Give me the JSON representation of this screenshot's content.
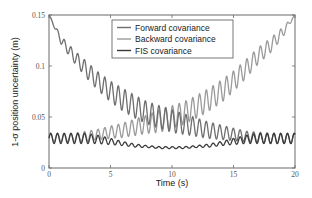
{
  "chart_data": {
    "type": "line",
    "title": "",
    "xlabel": "Time (s)",
    "ylabel": "1-σ position uncertainty (m)",
    "xlim": [
      0,
      20
    ],
    "ylim": [
      0,
      0.15
    ],
    "xticks": [
      0,
      5,
      10,
      15,
      20
    ],
    "xtick_labels": [
      "0",
      "5",
      "10",
      "15",
      "20"
    ],
    "yticks": [
      0,
      0.05,
      0.1,
      0.15
    ],
    "ytick_labels": [
      "0",
      "0.05",
      "0.1",
      "0.15"
    ],
    "grid": false,
    "legend_position": "upper center",
    "oscillation_period_s": 0.55,
    "series": [
      {
        "name": "Forward covariance",
        "color": "#6e6e6e",
        "x": [
          0,
          1,
          2,
          3,
          4,
          5,
          6,
          7,
          8,
          9,
          10,
          11,
          12,
          13,
          14,
          15,
          16,
          17,
          18,
          19,
          20
        ],
        "values": [
          0.15,
          0.125,
          0.11,
          0.097,
          0.085,
          0.075,
          0.067,
          0.06,
          0.054,
          0.05,
          0.046,
          0.043,
          0.04,
          0.037,
          0.035,
          0.033,
          0.031,
          0.03,
          0.029,
          0.029,
          0.029
        ],
        "amplitude": [
          0.0,
          0.004,
          0.006,
          0.008,
          0.009,
          0.01,
          0.011,
          0.011,
          0.011,
          0.011,
          0.011,
          0.01,
          0.009,
          0.008,
          0.007,
          0.006,
          0.005,
          0.005,
          0.005,
          0.005,
          0.005
        ]
      },
      {
        "name": "Backward covariance",
        "color": "#9a9a9a",
        "x": [
          0,
          1,
          2,
          3,
          4,
          5,
          6,
          7,
          8,
          9,
          10,
          11,
          12,
          13,
          14,
          15,
          16,
          17,
          18,
          19,
          20
        ],
        "values": [
          0.03,
          0.03,
          0.03,
          0.031,
          0.033,
          0.035,
          0.037,
          0.04,
          0.043,
          0.046,
          0.05,
          0.054,
          0.06,
          0.067,
          0.075,
          0.085,
          0.097,
          0.11,
          0.12,
          0.133,
          0.15
        ],
        "amplitude": [
          0.004,
          0.004,
          0.004,
          0.005,
          0.005,
          0.006,
          0.007,
          0.008,
          0.009,
          0.011,
          0.011,
          0.011,
          0.011,
          0.011,
          0.011,
          0.01,
          0.009,
          0.008,
          0.007,
          0.005,
          0.0
        ]
      },
      {
        "name": "FIS covariance",
        "color": "#3a3a3a",
        "x": [
          0,
          1,
          2,
          3,
          4,
          5,
          6,
          7,
          8,
          9,
          10,
          11,
          12,
          13,
          14,
          15,
          16,
          17,
          18,
          19,
          20
        ],
        "values": [
          0.029,
          0.029,
          0.029,
          0.029,
          0.028,
          0.026,
          0.024,
          0.022,
          0.021,
          0.02,
          0.02,
          0.02,
          0.021,
          0.022,
          0.024,
          0.026,
          0.028,
          0.029,
          0.029,
          0.029,
          0.029
        ],
        "amplitude": [
          0.005,
          0.005,
          0.005,
          0.005,
          0.004,
          0.003,
          0.002,
          0.0015,
          0.001,
          0.001,
          0.001,
          0.001,
          0.001,
          0.0015,
          0.002,
          0.003,
          0.004,
          0.005,
          0.005,
          0.005,
          0.005
        ]
      }
    ]
  },
  "legend": {
    "items": [
      {
        "label": "Forward covariance",
        "color": "#6e6e6e"
      },
      {
        "label": "Backward covariance",
        "color": "#9a9a9a"
      },
      {
        "label": "FIS covariance",
        "color": "#3a3a3a"
      }
    ]
  }
}
